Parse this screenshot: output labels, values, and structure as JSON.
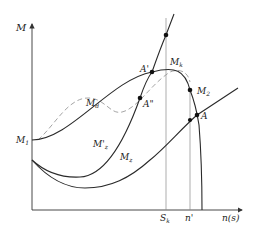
{
  "diagram": {
    "axes": {
      "y_label": "M",
      "x_label": "n(s)"
    },
    "x_ticks": {
      "sk": "S",
      "sk_sub": "k",
      "n_prime": "n'"
    },
    "curve_labels": {
      "m1": "M",
      "m1_sub": "1",
      "md": "M",
      "md_sub": "d",
      "mk": "M",
      "mk_sub": "k",
      "m2": "M",
      "m2_sub": "2",
      "mz_prime": "M'",
      "mz_prime_sub": "z",
      "mz": "M",
      "mz_sub": "z"
    },
    "points": {
      "a_prime": "A'",
      "a_double_prime": "A\"",
      "a": "A"
    },
    "colors": {
      "line": "#2a2a2a",
      "dashed": "#9a9a9a",
      "guide": "#8a8a8a"
    }
  }
}
